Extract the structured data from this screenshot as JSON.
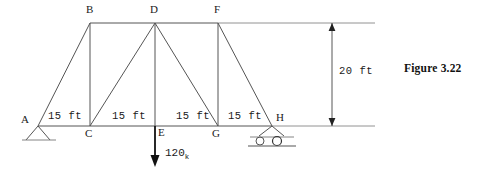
{
  "figure": {
    "caption": "Figure 3.22",
    "type": "truss-structural-diagram"
  },
  "nodes": {
    "A": {
      "label": "A",
      "x": 38,
      "y": 126,
      "label_x": 21,
      "label_y": 114
    },
    "B": {
      "label": "B",
      "x": 90,
      "y": 23,
      "label_x": 86,
      "label_y": 5
    },
    "C": {
      "label": "C",
      "x": 90,
      "y": 126,
      "label_x": 86,
      "label_y": 129
    },
    "D": {
      "label": "D",
      "x": 155,
      "y": 23,
      "label_x": 150,
      "label_y": 5
    },
    "E": {
      "label": "E",
      "x": 155,
      "y": 126,
      "label_x": 157,
      "label_y": 128
    },
    "F": {
      "label": "F",
      "x": 218,
      "y": 23,
      "label_x": 214,
      "label_y": 5
    },
    "G": {
      "label": "G",
      "x": 218,
      "y": 126,
      "label_x": 213,
      "label_y": 129
    },
    "H": {
      "label": "H",
      "x": 272,
      "y": 126,
      "label_x": 276,
      "label_y": 113
    }
  },
  "members": [
    {
      "name": "A-B",
      "from": "A",
      "to": "B"
    },
    {
      "name": "B-D",
      "from": "B",
      "to": "D"
    },
    {
      "name": "D-F",
      "from": "D",
      "to": "F"
    },
    {
      "name": "A-C",
      "from": "A",
      "to": "C"
    },
    {
      "name": "C-E",
      "from": "C",
      "to": "E"
    },
    {
      "name": "E-G",
      "from": "E",
      "to": "G"
    },
    {
      "name": "G-H",
      "from": "G",
      "to": "H"
    },
    {
      "name": "B-C",
      "from": "B",
      "to": "C"
    },
    {
      "name": "D-E",
      "from": "D",
      "to": "E"
    },
    {
      "name": "F-G",
      "from": "F",
      "to": "G"
    },
    {
      "name": "C-D",
      "from": "C",
      "to": "D"
    },
    {
      "name": "D-G",
      "from": "D",
      "to": "G"
    },
    {
      "name": "F-H",
      "from": "F",
      "to": "H"
    }
  ],
  "dimensions": {
    "spans": [
      {
        "label": "15 ft",
        "x": 48,
        "y": 113
      },
      {
        "label": "15 ft",
        "x": 113,
        "y": 113
      },
      {
        "label": "15 ft",
        "x": 176,
        "y": 113
      },
      {
        "label": "15 ft",
        "x": 228,
        "y": 113
      }
    ],
    "height": {
      "label": "20 ft",
      "value": 20,
      "unit": "ft",
      "label_x": 340,
      "label_y": 68,
      "line_x": 332,
      "top_y": 23,
      "bottom_y": 126
    },
    "extension_line_end_x": 375
  },
  "load": {
    "magnitude": "120",
    "unit_symbol": "k",
    "applied_at": "E",
    "label_x": 165,
    "label_y": 152,
    "arrow_x": 155,
    "arrow_top_y": 126,
    "arrow_bottom_y": 166
  },
  "supports": {
    "pin": {
      "name": "pin-support",
      "at": "A",
      "x": 38,
      "y": 126
    },
    "roller": {
      "name": "roller-support",
      "at": "H",
      "x": 272,
      "y": 126
    }
  },
  "style": {
    "line_color": "#555555",
    "heavy_line_color": "#111111",
    "text_color": "#1a1a1a"
  }
}
